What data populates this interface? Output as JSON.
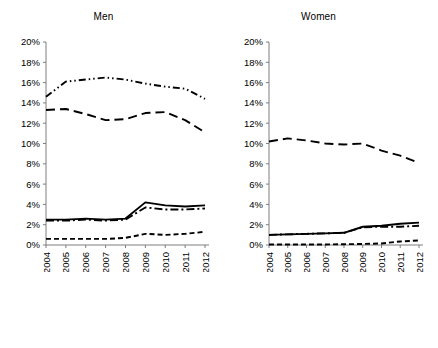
{
  "chart_data": [
    {
      "type": "line",
      "title": "Men",
      "xlabel": "",
      "ylabel": "",
      "x": [
        "2004",
        "2005",
        "2006",
        "2007",
        "2008",
        "2009",
        "2010",
        "2011",
        "2012"
      ],
      "ylim": [
        0,
        20
      ],
      "ytick_labels": [
        "0%",
        "2%",
        "4%",
        "6%",
        "8%",
        "10%",
        "12%",
        "14%",
        "16%",
        "18%",
        "20%"
      ],
      "ytick_values": [
        0,
        2,
        4,
        6,
        8,
        10,
        12,
        14,
        16,
        18,
        20
      ],
      "grid": false,
      "legend_position": "below",
      "series": [
        {
          "name": "JSA 50-54",
          "style": "solid",
          "values": [
            2.5,
            2.5,
            2.6,
            2.5,
            2.6,
            4.2,
            3.9,
            3.8,
            3.9
          ]
        },
        {
          "name": "JSA 55-59",
          "style": "dashed-long",
          "values": [
            13.3,
            13.4,
            12.9,
            12.3,
            12.4,
            13.0,
            13.1,
            12.3,
            11.1
          ]
        },
        {
          "name": "JSA 60-64",
          "style": "dashed",
          "values": [
            0.6,
            0.6,
            0.6,
            0.6,
            0.7,
            1.1,
            1.0,
            1.1,
            1.3
          ]
        },
        {
          "name": "PC 60-64",
          "style": "dash-dot",
          "values": [
            2.4,
            2.4,
            2.5,
            2.4,
            2.5,
            3.7,
            3.5,
            3.5,
            3.6
          ]
        },
        {
          "name": "PC 65-69",
          "style": "dash-dot-dot",
          "values": [
            14.6,
            16.1,
            16.3,
            16.5,
            16.3,
            15.9,
            15.6,
            15.4,
            14.4
          ]
        }
      ]
    },
    {
      "type": "line",
      "title": "Women",
      "xlabel": "",
      "ylabel": "",
      "x": [
        "2004",
        "2005",
        "2006",
        "2007",
        "2008",
        "2009",
        "2010",
        "2011",
        "2012"
      ],
      "ylim": [
        0,
        20
      ],
      "ytick_labels": [
        "0%",
        "2%",
        "4%",
        "6%",
        "8%",
        "10%",
        "12%",
        "14%",
        "16%",
        "18%",
        "20%"
      ],
      "ytick_values": [
        0,
        2,
        4,
        6,
        8,
        10,
        12,
        14,
        16,
        18,
        20
      ],
      "grid": false,
      "legend_position": "below",
      "series": [
        {
          "name": "JSA 50-54",
          "style": "solid",
          "values": [
            1.0,
            1.05,
            1.1,
            1.15,
            1.2,
            1.8,
            1.9,
            2.1,
            2.2
          ]
        },
        {
          "name": "JSA 55-59",
          "style": "dashed-long",
          "values": [
            10.2,
            10.5,
            10.3,
            10.0,
            9.9,
            10.0,
            9.3,
            8.8,
            8.1
          ]
        },
        {
          "name": "JSA 60-64",
          "style": "dashed",
          "values": [
            0.05,
            0.05,
            0.05,
            0.05,
            0.08,
            0.1,
            0.15,
            0.35,
            0.45
          ]
        },
        {
          "name": "PC 60-64",
          "style": "dash-dot",
          "values": [
            1.0,
            1.05,
            1.1,
            1.15,
            1.2,
            1.75,
            1.8,
            1.8,
            1.9
          ]
        }
      ]
    }
  ],
  "panels": {
    "men": {
      "title": "Men",
      "y_labels": [
        "20%",
        "18%",
        "16%",
        "14%",
        "12%",
        "10%",
        "8%",
        "6%",
        "4%",
        "2%",
        "0%"
      ],
      "x_labels": [
        "2004",
        "2005",
        "2006",
        "2007",
        "2008",
        "2009",
        "2010",
        "2011",
        "2012"
      ]
    },
    "women": {
      "title": "Women",
      "y_labels": [
        "20%",
        "18%",
        "16%",
        "14%",
        "12%",
        "10%",
        "8%",
        "6%",
        "4%",
        "2%",
        "0%"
      ],
      "x_labels": [
        "2004",
        "2005",
        "2006",
        "2007",
        "2008",
        "2009",
        "2010",
        "2011",
        "2012"
      ]
    }
  },
  "legend_left": {
    "rows": [
      [
        {
          "label": "JSA 50-54",
          "style": "solid"
        },
        {
          "label": "JSA 55-59",
          "style": "dash-dot"
        }
      ],
      [
        {
          "label": "JSA 60-64",
          "style": "dashed"
        },
        {
          "label": "PC 60-64",
          "style": "dash-dot"
        }
      ],
      [
        {
          "label": "PC 65-69",
          "style": "dash-dot"
        }
      ]
    ]
  },
  "legend_right": {
    "rows": [
      [
        {
          "label": "JSA 50-54",
          "style": "solid"
        },
        {
          "label": "JSA 55-59",
          "style": "dash-dot"
        }
      ],
      [
        {
          "label": "JSA 60-64",
          "style": "dashed"
        },
        {
          "label": "PC 60-64",
          "style": "dash-dot"
        }
      ]
    ]
  },
  "colors": {
    "line": "#000000",
    "axis": "#7f7f7f",
    "background": "#ffffff"
  }
}
